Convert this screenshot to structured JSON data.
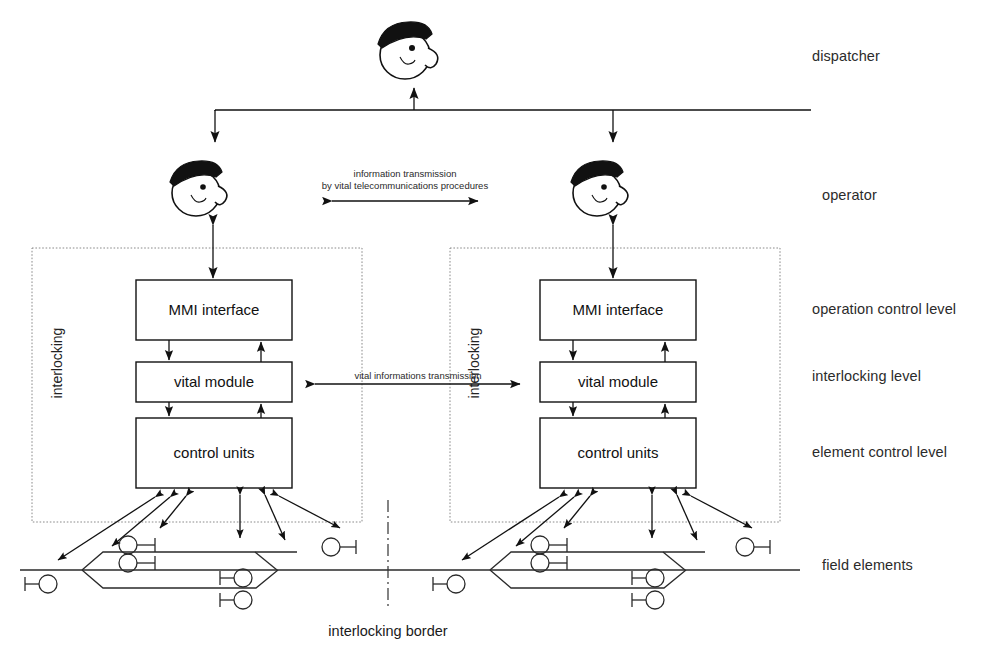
{
  "diagram": {
    "actors": {
      "dispatcher": {
        "label": "dispatcher",
        "icon": "person-with-cap-icon"
      },
      "operator": {
        "label": "operator",
        "icon": "person-with-cap-icon"
      }
    },
    "level_labels": [
      {
        "id": "dispatcher",
        "label": "dispatcher"
      },
      {
        "id": "operator",
        "label": "operator"
      },
      {
        "id": "operation-control-level",
        "label": "operation control level"
      },
      {
        "id": "interlocking-level",
        "label": "interlocking level"
      },
      {
        "id": "element-control-level",
        "label": "element control level"
      },
      {
        "id": "field-elements",
        "label": "field elements"
      }
    ],
    "interlockings": [
      {
        "id": "left",
        "group_label": "interlocking",
        "units": [
          {
            "id": "mmi",
            "label": "MMI interface"
          },
          {
            "id": "vital",
            "label": "vital module"
          },
          {
            "id": "control",
            "label": "control units"
          }
        ]
      },
      {
        "id": "right",
        "group_label": "interlocking",
        "units": [
          {
            "id": "mmi",
            "label": "MMI interface"
          },
          {
            "id": "vital",
            "label": "vital module"
          },
          {
            "id": "control",
            "label": "control units"
          }
        ]
      }
    ],
    "annotations": {
      "telecom_line1": "information transmission",
      "telecom_line2": "by vital  telecommunications procedures",
      "vital_transmission": "vital informations transmission",
      "interlocking_border": "interlocking border"
    },
    "colors": {
      "ink": "#111111",
      "box_stroke": "#111111",
      "dotted_group": "#8a8a8a",
      "track": "#2a2a2a",
      "background": "#ffffff"
    }
  }
}
